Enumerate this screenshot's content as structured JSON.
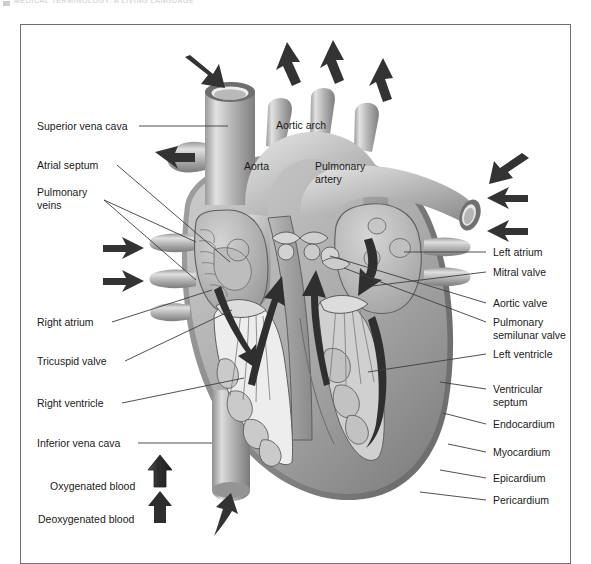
{
  "scan_header": {
    "text": "MEDICAL TERMINOLOGY:  A  LIVING  LANGUAGE"
  },
  "figure": {
    "colors": {
      "frame_border": "#6f6f6f",
      "tissue_light": "#d9d9d9",
      "tissue_mid": "#a8a8a8",
      "tissue_dark": "#808080",
      "chamber_fill": "#b9b9b9",
      "arrow_dark": "#3a3a3a",
      "leader_line": "#3d3d3d",
      "text": "#1b1b1b"
    }
  },
  "labels_left": [
    {
      "id": "superior-vena-cava",
      "text": "Superior vena cava"
    },
    {
      "id": "atrial-septum",
      "text": "Atrial septum"
    },
    {
      "id": "pulmonary-veins",
      "text": "Pulmonary\nveins"
    },
    {
      "id": "right-atrium",
      "text": "Right atrium"
    },
    {
      "id": "tricuspid-valve",
      "text": "Tricuspid valve"
    },
    {
      "id": "right-ventricle",
      "text": "Right ventricle"
    },
    {
      "id": "inferior-vena-cava",
      "text": "Inferior vena cava"
    }
  ],
  "labels_right": [
    {
      "id": "left-atrium",
      "text": "Left atrium"
    },
    {
      "id": "mitral-valve",
      "text": "Mitral valve"
    },
    {
      "id": "aortic-valve",
      "text": "Aortic valve"
    },
    {
      "id": "pulmonary-semilunar-valve",
      "text": "Pulmonary\nsemilunar valve"
    },
    {
      "id": "left-ventricle",
      "text": "Left ventricle"
    },
    {
      "id": "ventricular-septum",
      "text": "Ventricular\nseptum"
    },
    {
      "id": "endocardium",
      "text": "Endocardium"
    },
    {
      "id": "myocardium",
      "text": "Myocardium"
    },
    {
      "id": "epicardium",
      "text": "Epicardium"
    },
    {
      "id": "pericardium",
      "text": "Pericardium"
    }
  ],
  "labels_internal": [
    {
      "id": "aortic-arch",
      "text": "Aortic arch"
    },
    {
      "id": "aorta",
      "text": "Aorta"
    },
    {
      "id": "pulmonary-artery",
      "text": "Pulmonary\nartery"
    }
  ],
  "legend": {
    "items": [
      {
        "id": "oxygenated-blood",
        "text": "Oxygenated blood",
        "arrow": "arrow-up-outline"
      },
      {
        "id": "deoxygenated-blood",
        "text": "Deoxygenated blood",
        "arrow": "arrow-up-solid"
      }
    ]
  },
  "flow_arrows": {
    "inflow_count": 6,
    "outflow_count": 4,
    "internal_count": 5
  }
}
